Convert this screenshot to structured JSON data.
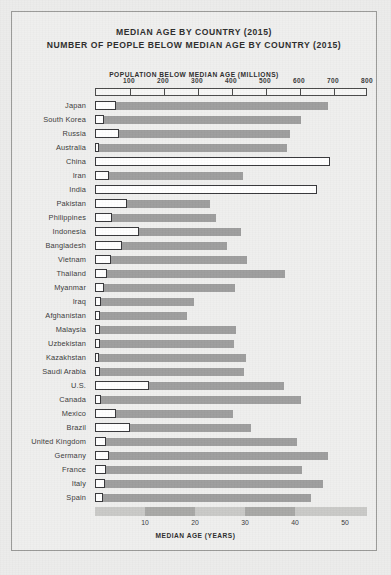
{
  "figure": {
    "title_line_1": "MEDIAN AGE BY COUNTRY (2015)",
    "title_line_2": "NUMBER OF PEOPLE BELOW MEDIAN AGE BY COUNTRY (2015)",
    "top_axis_label": "POPULATION BELOW MEDIAN AGE (MILLIONS)",
    "bottom_axis_label": "MEDIAN AGE (YEARS)"
  },
  "colors": {
    "page_background": "#ececeb",
    "frame_border": "#9a9a98",
    "age_bar_fill": "#9e9e9e",
    "population_bar_fill": "#ffffff",
    "population_bar_stroke": "#37373a",
    "text": "#2d2d2d",
    "bottom_band_light": "#c9c9c7",
    "bottom_band_dark": "#a8a8a6"
  },
  "chart_data": {
    "type": "bar",
    "orientation": "horizontal",
    "grid": false,
    "legend_position": "none",
    "categories": [
      "Japan",
      "South Korea",
      "Russia",
      "Australia",
      "China",
      "Iran",
      "India",
      "Pakistan",
      "Philippines",
      "Indonesia",
      "Bangladesh",
      "Vietnam",
      "Thailand",
      "Myanmar",
      "Iraq",
      "Afghanistan",
      "Malaysia",
      "Uzbekistan",
      "Kazakhstan",
      "Saudi Arabia",
      "U.S.",
      "Canada",
      "Mexico",
      "Brazil",
      "United Kingdom",
      "Germany",
      "France",
      "Italy",
      "Spain"
    ],
    "series": [
      {
        "name": "MEDIAN AGE (YEARS)",
        "axis": "bottom",
        "unit": "years",
        "xlabel": "MEDIAN AGE (YEARS)",
        "xlim": [
          0,
          54.4
        ],
        "ticks": [
          10,
          20,
          30,
          40,
          50
        ],
        "values": [
          46.5,
          41.2,
          38.9,
          38.3,
          37.0,
          29.5,
          27.3,
          23.0,
          24.2,
          29.2,
          26.3,
          30.4,
          38.0,
          27.9,
          19.7,
          18.4,
          28.2,
          27.8,
          30.2,
          29.8,
          37.8,
          41.2,
          27.6,
          31.1,
          40.4,
          46.5,
          41.4,
          45.5,
          43.2
        ]
      },
      {
        "name": "POPULATION BELOW MEDIAN AGE (MILLIONS)",
        "axis": "top",
        "unit": "millions",
        "xlabel": "POPULATION BELOW MEDIAN AGE (MILLIONS)",
        "xlim": [
          0,
          800
        ],
        "ticks": [
          100,
          200,
          300,
          400,
          500,
          600,
          700,
          800
        ],
        "values": [
          63,
          25,
          72,
          12,
          692,
          40,
          654,
          94,
          51,
          128,
          80,
          46,
          34,
          27,
          18,
          16,
          15,
          16,
          9,
          16,
          160,
          18,
          63,
          104,
          32,
          41,
          33,
          30,
          23
        ]
      }
    ]
  }
}
